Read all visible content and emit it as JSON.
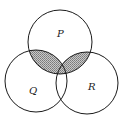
{
  "diagram": {
    "type": "venn",
    "sets": [
      {
        "name": "P",
        "label": "P",
        "cx": 60,
        "cy": 42,
        "r": 32,
        "label_x": 57,
        "label_y": 37
      },
      {
        "name": "Q",
        "label": "Q",
        "cx": 36,
        "cy": 81,
        "r": 31,
        "label_x": 29,
        "label_y": 94
      },
      {
        "name": "R",
        "label": "R",
        "cx": 87,
        "cy": 83,
        "r": 31,
        "label_x": 88,
        "label_y": 90
      }
    ],
    "shaded_regions": [
      "P∩Q",
      "P∩R"
    ],
    "colors": {
      "stroke": "#1a1a1a",
      "shade": "#9a9a9a",
      "background": "#ffffff"
    }
  }
}
